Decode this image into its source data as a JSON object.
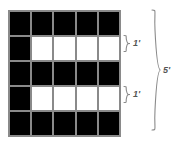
{
  "diagram": {
    "type": "grid-with-dimension-braces",
    "title": "",
    "background_color": "#ffffff",
    "grid": {
      "rows": 5,
      "columns": 5,
      "cell_colors": {
        "filled": "#000000",
        "empty": "#ffffff"
      },
      "gridline_color": "#8a8a8a",
      "cells": [
        [
          "black",
          "black",
          "black",
          "black",
          "black"
        ],
        [
          "black",
          "white",
          "white",
          "white",
          "white"
        ],
        [
          "black",
          "black",
          "black",
          "black",
          "black"
        ],
        [
          "black",
          "white",
          "white",
          "white",
          "white"
        ],
        [
          "black",
          "black",
          "black",
          "black",
          "black"
        ]
      ]
    },
    "annotations": [
      {
        "name": "row-2-height-brace",
        "label": "1'",
        "spans_rows": [
          2,
          2
        ],
        "orientation": "vertical",
        "side": "right"
      },
      {
        "name": "row-4-height-brace",
        "label": "1'",
        "spans_rows": [
          4,
          4
        ],
        "orientation": "vertical",
        "side": "right"
      },
      {
        "name": "total-height-brace",
        "label": "5'",
        "spans_rows": [
          1,
          5
        ],
        "orientation": "vertical",
        "side": "right"
      }
    ],
    "label_color": "#555555",
    "brace_color": "#8a8a8a"
  }
}
